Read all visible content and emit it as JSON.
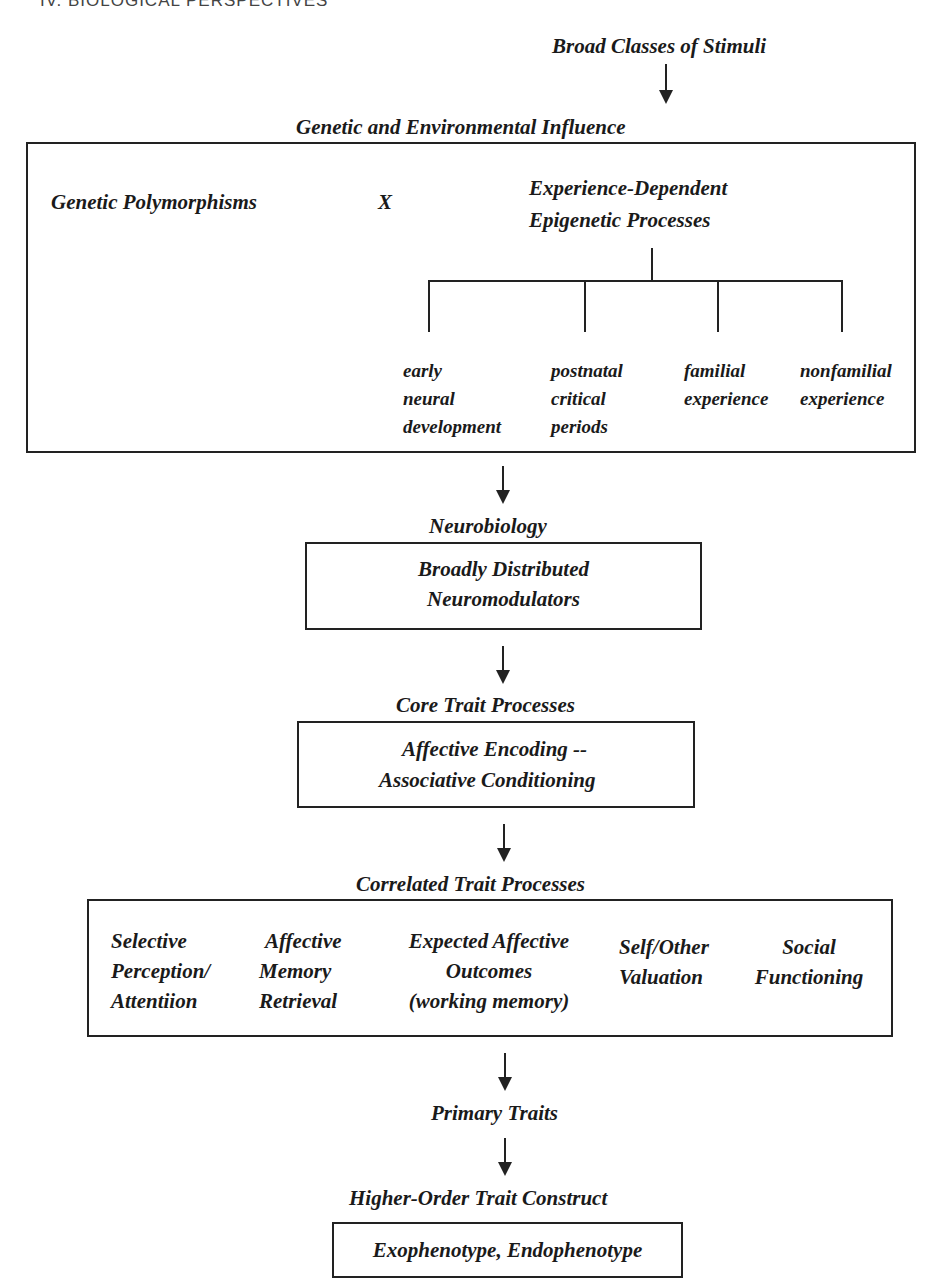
{
  "running_head": "IV. BIOLOGICAL PERSPECTIVES",
  "stimuli": {
    "label": "Broad Classes of Stimuli"
  },
  "genetic_env": {
    "title": "Genetic and Environmental Influence",
    "genetic": "Genetic Polymorphisms",
    "operator": "X",
    "epigenetic_line1": "Experience-Dependent",
    "epigenetic_line2": "Epigenetic Processes",
    "branches": [
      {
        "lines": [
          "early",
          "neural",
          "development"
        ]
      },
      {
        "lines": [
          "postnatal",
          "critical",
          "periods"
        ]
      },
      {
        "lines": [
          "familial",
          "experience"
        ]
      },
      {
        "lines": [
          "nonfamilial",
          "experience"
        ]
      }
    ]
  },
  "neurobiology": {
    "title": "Neurobiology",
    "line1": "Broadly Distributed",
    "line2": "Neuromodulators"
  },
  "core": {
    "title": "Core Trait Processes",
    "line1": "Affective Encoding --",
    "line2": "Associative Conditioning"
  },
  "correlated": {
    "title": "Correlated Trait Processes",
    "items": [
      {
        "lines": [
          "Selective",
          "Perception/",
          "Attentiion"
        ]
      },
      {
        "lines": [
          "Affective",
          "Memory",
          "Retrieval"
        ]
      },
      {
        "lines": [
          "Expected Affective",
          "Outcomes",
          "(working memory)"
        ]
      },
      {
        "lines": [
          "Self/Other",
          "Valuation"
        ]
      },
      {
        "lines": [
          "Social",
          "Functioning"
        ]
      }
    ]
  },
  "primary": {
    "title": "Primary Traits"
  },
  "higher": {
    "title": "Higher-Order Trait Construct",
    "box": "Exophenotype, Endophenotype"
  }
}
